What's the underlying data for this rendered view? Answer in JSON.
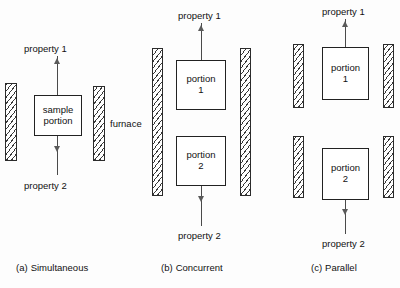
{
  "figure": {
    "furnace_label": "furnace",
    "panels": [
      {
        "id": "a",
        "caption_index": "(a)",
        "caption_text": "Simultaneous",
        "top_label": "property 1",
        "bottom_label": "property 2",
        "boxes": [
          {
            "line1": "sample",
            "line2": "portion"
          }
        ],
        "walls": 2
      },
      {
        "id": "b",
        "caption_index": "(b)",
        "caption_text": "Concurrent",
        "top_label": "property 1",
        "bottom_label": "property 2",
        "boxes": [
          {
            "line1": "portion",
            "line2": "1"
          },
          {
            "line1": "portion",
            "line2": "2"
          }
        ],
        "walls": 2
      },
      {
        "id": "c",
        "caption_index": "(c)",
        "caption_text": "Parallel",
        "top_label": "property 1",
        "bottom_label": "property 2",
        "boxes": [
          {
            "line1": "portion",
            "line2": "1"
          },
          {
            "line1": "portion",
            "line2": "2"
          }
        ],
        "walls": 4
      }
    ],
    "colors": {
      "stroke": "#222222",
      "hatch": "#3a3a3a",
      "arrow": "#5a5a5a",
      "background": "#fdfdfd"
    }
  }
}
